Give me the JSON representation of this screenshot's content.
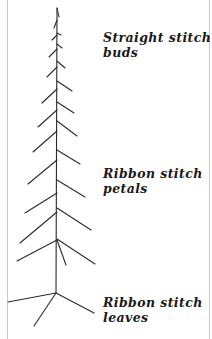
{
  "figure": {
    "line_color": "#2a2a2a",
    "labels": [
      {
        "id": "buds",
        "line1": "Straight stitch",
        "line2": "buds"
      },
      {
        "id": "petals",
        "line1": "Ribbon stitch",
        "line2": "petals"
      },
      {
        "id": "leaves",
        "line1": "Ribbon stitch",
        "line2": "leaves"
      }
    ]
  }
}
